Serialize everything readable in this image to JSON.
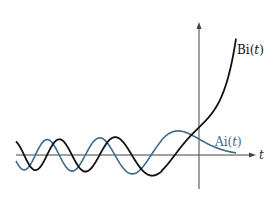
{
  "chart_data": {
    "type": "line",
    "title": "",
    "xlabel": "t",
    "ylabel": "",
    "grid": false,
    "legend": "inline labels",
    "xlim": [
      -8.9,
      2.7
    ],
    "ylim": [
      -0.75,
      3.2
    ],
    "annotations": [
      {
        "text": "Bi(t)",
        "near": "upper right of Bi curve"
      },
      {
        "text": "Ai(t)",
        "near": "right of Ai peak"
      }
    ],
    "series": [
      {
        "name": "Ai(t)",
        "color": "#3d6a8c",
        "x": [
          -8.8,
          -8.6,
          -8.4,
          -8.2,
          -8.0,
          -7.8,
          -7.6,
          -7.4,
          -7.2,
          -7.0,
          -6.8,
          -6.6,
          -6.4,
          -6.2,
          -6.0,
          -5.8,
          -5.6,
          -5.4,
          -5.2,
          -5.0,
          -4.8,
          -4.6,
          -4.4,
          -4.2,
          -4.0,
          -3.8,
          -3.6,
          -3.4,
          -3.2,
          -3.0,
          -2.8,
          -2.6,
          -2.4,
          -2.2,
          -2.0,
          -1.8,
          -1.6,
          -1.4,
          -1.2,
          -1.0,
          -0.8,
          -0.6,
          -0.4,
          -0.2,
          0.0,
          0.2,
          0.4,
          0.6,
          0.8,
          1.0,
          1.2,
          1.4,
          1.6,
          1.8
        ],
        "y": [
          0.2,
          0.33,
          0.19,
          -0.1,
          -0.35,
          -0.34,
          -0.08,
          0.23,
          0.38,
          0.18,
          -0.15,
          -0.37,
          -0.3,
          -0.02,
          0.27,
          0.37,
          0.14,
          -0.17,
          -0.38,
          -0.33,
          -0.05,
          0.26,
          0.39,
          0.29,
          -0.07,
          -0.37,
          -0.35,
          -0.08,
          0.21,
          0.38,
          0.36,
          0.18,
          -0.01,
          0.29,
          0.23,
          0.35,
          0.46,
          0.52,
          0.54,
          0.54,
          0.5,
          0.44,
          0.39,
          0.33,
          0.355,
          0.3,
          0.25,
          0.2,
          0.16,
          0.135,
          0.11,
          0.08,
          0.06,
          0.04
        ]
      },
      {
        "name": "Bi(t)",
        "color": "#111111",
        "x": [
          -8.8,
          -8.6,
          -8.4,
          -8.2,
          -8.0,
          -7.8,
          -7.6,
          -7.4,
          -7.2,
          -7.0,
          -6.8,
          -6.6,
          -6.4,
          -6.2,
          -6.0,
          -5.8,
          -5.6,
          -5.4,
          -5.2,
          -5.0,
          -4.8,
          -4.6,
          -4.4,
          -4.2,
          -4.0,
          -3.8,
          -3.6,
          -3.4,
          -3.2,
          -3.0,
          -2.8,
          -2.6,
          -2.4,
          -2.2,
          -2.0,
          -1.8,
          -1.6,
          -1.4,
          -1.2,
          -1.0,
          -0.8,
          -0.6,
          -0.4,
          -0.2,
          0.0,
          0.2,
          0.4,
          0.6,
          0.8,
          1.0,
          1.2,
          1.4,
          1.6,
          1.8
        ],
        "y": [
          -0.3,
          -0.04,
          0.26,
          0.34,
          0.19,
          -0.12,
          -0.36,
          -0.33,
          -0.09,
          0.2,
          0.36,
          0.29,
          0.01,
          -0.28,
          -0.38,
          -0.22,
          0.08,
          0.34,
          0.38,
          0.14,
          -0.18,
          -0.38,
          -0.3,
          -0.02,
          -0.04,
          0.06,
          0.24,
          0.35,
          0.39,
          -0.2,
          -0.34,
          -0.4,
          -0.4,
          -0.35,
          -0.41,
          -0.32,
          -0.2,
          -0.05,
          0.08,
          0.1,
          0.25,
          0.38,
          0.5,
          0.57,
          0.615,
          0.68,
          0.8,
          0.97,
          1.22,
          1.59,
          2.03,
          2.45,
          2.9,
          3.2
        ]
      }
    ]
  },
  "labels": {
    "bi": "Bi(",
    "bi_var": "t",
    "bi_close": ")",
    "ai": "Ai(",
    "ai_var": "t",
    "ai_close": ")",
    "t_axis": "t"
  }
}
